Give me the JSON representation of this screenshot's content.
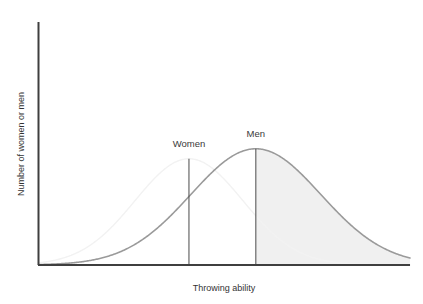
{
  "chart_data": {
    "type": "line",
    "title": "",
    "subtitle": "",
    "xlabel": "Throwing ability",
    "ylabel": "Number of women or men",
    "grid": false,
    "legend_position": "inline-annotations",
    "axis": {
      "x_ticks": [],
      "y_ticks": [],
      "xlim": [
        0,
        100
      ],
      "ylim": [
        0,
        100
      ],
      "x_axis_visible": true,
      "y_axis_visible": true,
      "tick_labels_shown": false
    },
    "series": [
      {
        "name": "Women",
        "distribution": "normal",
        "mean": 40.5,
        "std_dev": 14.5,
        "peak_value": 85,
        "color": "#f2f2f2",
        "line_width": 1.4,
        "x": [
          0,
          5,
          10,
          15,
          20,
          25,
          30,
          35,
          40,
          45,
          50,
          55,
          60,
          65,
          70,
          75,
          80,
          85,
          90,
          95,
          100
        ],
        "values": [
          1,
          3,
          7,
          14,
          26,
          42,
          60,
          77,
          85,
          83,
          70,
          53,
          36,
          22,
          12,
          6,
          3,
          1,
          0,
          0,
          0
        ]
      },
      {
        "name": "Men",
        "distribution": "normal",
        "mean": 58.5,
        "std_dev": 17.5,
        "peak_value": 93,
        "color": "#9a9a9a",
        "line_width": 1.6,
        "x": [
          0,
          5,
          10,
          15,
          20,
          25,
          30,
          35,
          40,
          45,
          50,
          55,
          60,
          65,
          70,
          75,
          80,
          85,
          90,
          95,
          100
        ],
        "values": [
          1,
          2,
          4,
          8,
          15,
          25,
          38,
          54,
          70,
          85,
          92,
          93,
          88,
          76,
          60,
          43,
          28,
          16,
          8,
          3,
          1
        ]
      }
    ],
    "annotations": [
      {
        "label": "Women",
        "type": "mean-marker",
        "x": 40.5,
        "line_top_value": 85,
        "line_color": "#4a4a4a"
      },
      {
        "label": "Men",
        "type": "mean-marker",
        "x": 58.5,
        "line_top_value": 93,
        "line_color": "#4a4a4a"
      }
    ],
    "shaded_region": {
      "series": "Men",
      "from_x": 58.5,
      "to_x": 100,
      "fill_color": "#f0f0f0",
      "description": "light shading under the Men curve to the right of the Men mean"
    }
  },
  "labels": {
    "y_axis": "Number of women or men",
    "x_axis": "Throwing ability",
    "women": "Women",
    "men": "Men"
  },
  "colors": {
    "axis": "#3f3f3f",
    "men_curve": "#9a9a9a",
    "women_curve": "#f2f2f2",
    "marker_line": "#4a4a4a",
    "shade": "#f0f0f0",
    "text": "#333333",
    "background": "#ffffff"
  }
}
